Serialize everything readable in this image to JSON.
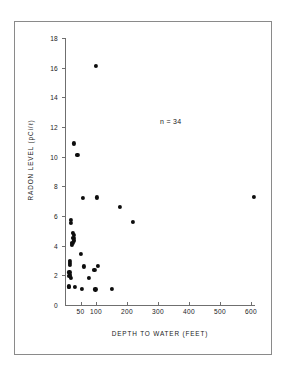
{
  "chart_data": {
    "type": "scatter",
    "title": "",
    "xlabel": "DEPTH TO WATER (FEET)",
    "ylabel": "RADON LEVEL (pCi/ℓ)",
    "annotation": "n = 34",
    "n": 34,
    "grid": false,
    "legend": null,
    "xlim": [
      0,
      650
    ],
    "ylim": [
      0,
      18
    ],
    "xticks": [
      50,
      100,
      200,
      300,
      400,
      500,
      600
    ],
    "xticklabels": [
      "50",
      "100",
      "200",
      "300",
      "400",
      "500",
      "600"
    ],
    "yticks": [
      0,
      2,
      4,
      6,
      8,
      10,
      12,
      14,
      16,
      18
    ],
    "yticklabels": [
      "0",
      "2",
      "4",
      "6",
      "8",
      "10",
      "12",
      "14",
      "16",
      "18"
    ],
    "marker": "filled-circle",
    "marker_color": "#0d0d0d",
    "axis_color": "#6f6f6f",
    "points": [
      {
        "x": 100,
        "y": 16.1
      },
      {
        "x": 30,
        "y": 10.9
      },
      {
        "x": 40,
        "y": 10.1
      },
      {
        "x": 58,
        "y": 7.2
      },
      {
        "x": 103,
        "y": 7.25
      },
      {
        "x": 610,
        "y": 7.3
      },
      {
        "x": 178,
        "y": 6.6
      },
      {
        "x": 18,
        "y": 5.75
      },
      {
        "x": 20,
        "y": 5.55
      },
      {
        "x": 220,
        "y": 5.6
      },
      {
        "x": 26,
        "y": 4.85
      },
      {
        "x": 28,
        "y": 4.7
      },
      {
        "x": 27,
        "y": 4.5
      },
      {
        "x": 30,
        "y": 4.35
      },
      {
        "x": 24,
        "y": 4.2
      },
      {
        "x": 22,
        "y": 4.05
      },
      {
        "x": 52,
        "y": 3.45
      },
      {
        "x": 15,
        "y": 3.0
      },
      {
        "x": 17,
        "y": 2.85
      },
      {
        "x": 16,
        "y": 2.7
      },
      {
        "x": 60,
        "y": 2.6
      },
      {
        "x": 105,
        "y": 2.65
      },
      {
        "x": 95,
        "y": 2.35
      },
      {
        "x": 14,
        "y": 2.2
      },
      {
        "x": 16,
        "y": 2.05
      },
      {
        "x": 14,
        "y": 1.95
      },
      {
        "x": 18,
        "y": 1.85
      },
      {
        "x": 78,
        "y": 1.8
      },
      {
        "x": 13,
        "y": 1.25
      },
      {
        "x": 12,
        "y": 1.2
      },
      {
        "x": 32,
        "y": 1.2
      },
      {
        "x": 55,
        "y": 1.1
      },
      {
        "x": 98,
        "y": 1.05
      },
      {
        "x": 150,
        "y": 1.1
      }
    ]
  }
}
